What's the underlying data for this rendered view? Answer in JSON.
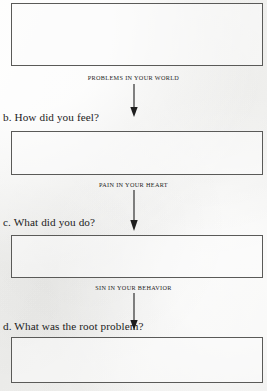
{
  "document": {
    "type": "worksheet-page",
    "ink_color": "#1b1b1b",
    "rule_color": "#5a5a58",
    "paper_color": "#f3f3f1"
  },
  "steps": [
    {
      "id": "a",
      "question": "",
      "box_name": "answer-box-a",
      "caption": "PROBLEMS IN YOUR WORLD"
    },
    {
      "id": "b",
      "question": "b. How did you feel?",
      "box_name": "answer-box-b",
      "caption": "PAIN IN YOUR HEART"
    },
    {
      "id": "c",
      "question": "c. What did you do?",
      "box_name": "answer-box-c",
      "caption": "SIN IN YOUR BEHAVIOR"
    },
    {
      "id": "d",
      "question": "d. What was the root problem?",
      "box_name": "answer-box-d",
      "caption": ""
    }
  ],
  "arrows": [
    {
      "name": "flow-arrow-1",
      "direction": "down"
    },
    {
      "name": "flow-arrow-2",
      "direction": "down"
    },
    {
      "name": "flow-arrow-3",
      "direction": "down"
    }
  ]
}
